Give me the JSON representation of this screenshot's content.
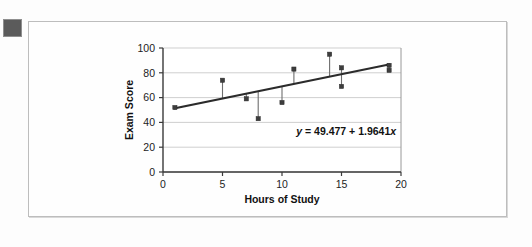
{
  "figure": {
    "bullet_marker": "filled-square-bullet"
  },
  "chart_data": {
    "type": "scatter",
    "title": "",
    "xlabel": "Hours of Study",
    "ylabel": "Exam Score",
    "xlim": [
      0,
      20
    ],
    "ylim": [
      0,
      100
    ],
    "xticks": [
      "0",
      "5",
      "10",
      "15",
      "20"
    ],
    "xtick_values": [
      0,
      5,
      10,
      15,
      20
    ],
    "yticks": [
      "0",
      "20",
      "40",
      "60",
      "80",
      "100"
    ],
    "ytick_values": [
      0,
      20,
      40,
      60,
      80,
      100
    ],
    "grid": "horizontal",
    "legend": "none",
    "points": [
      {
        "x": 1,
        "y": 52
      },
      {
        "x": 5,
        "y": 74
      },
      {
        "x": 7,
        "y": 59
      },
      {
        "x": 8,
        "y": 43
      },
      {
        "x": 10,
        "y": 56
      },
      {
        "x": 11,
        "y": 83
      },
      {
        "x": 14,
        "y": 95
      },
      {
        "x": 15,
        "y": 84
      },
      {
        "x": 15,
        "y": 69
      },
      {
        "x": 19,
        "y": 86
      },
      {
        "x": 19,
        "y": 82
      }
    ],
    "fit_line": {
      "intercept": 49.477,
      "slope": 1.9641,
      "x_start": 1,
      "x_end": 19,
      "style": "solid",
      "show_residual_stems": true
    },
    "annotation": {
      "equation_y": "y",
      "equation_rest": " = 49.477 + 1.9641",
      "equation_x": "x",
      "equation_full": "y = 49.477 + 1.9641x",
      "x_pos": 11.2,
      "y_pos": 30
    }
  }
}
